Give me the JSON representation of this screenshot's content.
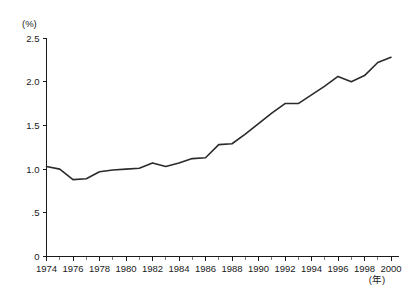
{
  "chart_data": {
    "type": "line",
    "title": "",
    "subtitle": "",
    "xlabel": "(年)",
    "ylabel": "(%)",
    "yunit": "(%)",
    "xunit": "(年)",
    "xlim": [
      1974,
      2000
    ],
    "ylim": [
      0,
      2.5
    ],
    "grid": false,
    "legend": null,
    "y_ticks": [
      0,
      0.5,
      1.0,
      1.5,
      2.0,
      2.5
    ],
    "y_tick_labels": [
      "0",
      ".5",
      "1.0",
      "1.5",
      "2.0",
      "2.5"
    ],
    "x_ticks": [
      1974,
      1975,
      1976,
      1977,
      1978,
      1979,
      1980,
      1981,
      1982,
      1983,
      1984,
      1985,
      1986,
      1987,
      1988,
      1989,
      1990,
      1991,
      1992,
      1993,
      1994,
      1995,
      1996,
      1997,
      1998,
      1999,
      2000
    ],
    "x_tick_labels_shown": [
      "1974",
      "1976",
      "1978",
      "1980",
      "1982",
      "1984",
      "1986",
      "1988",
      "1990",
      "1992",
      "1994",
      "1996",
      "1998",
      "2000"
    ],
    "x_label_interval": 2,
    "series": [
      {
        "name": "",
        "color": "#2b2b2b",
        "x": [
          1974,
          1975,
          1976,
          1977,
          1978,
          1979,
          1980,
          1981,
          1982,
          1983,
          1984,
          1985,
          1986,
          1987,
          1988,
          1989,
          1990,
          1991,
          1992,
          1993,
          1994,
          1995,
          1996,
          1997,
          1998,
          1999,
          2000
        ],
        "values": [
          1.03,
          1.0,
          0.88,
          0.89,
          0.97,
          0.99,
          1.0,
          1.01,
          1.07,
          1.03,
          1.07,
          1.12,
          1.13,
          1.28,
          1.29,
          1.4,
          1.52,
          1.64,
          1.75,
          1.75,
          1.85,
          1.95,
          2.06,
          2.0,
          2.07,
          2.22,
          2.28
        ]
      }
    ]
  }
}
